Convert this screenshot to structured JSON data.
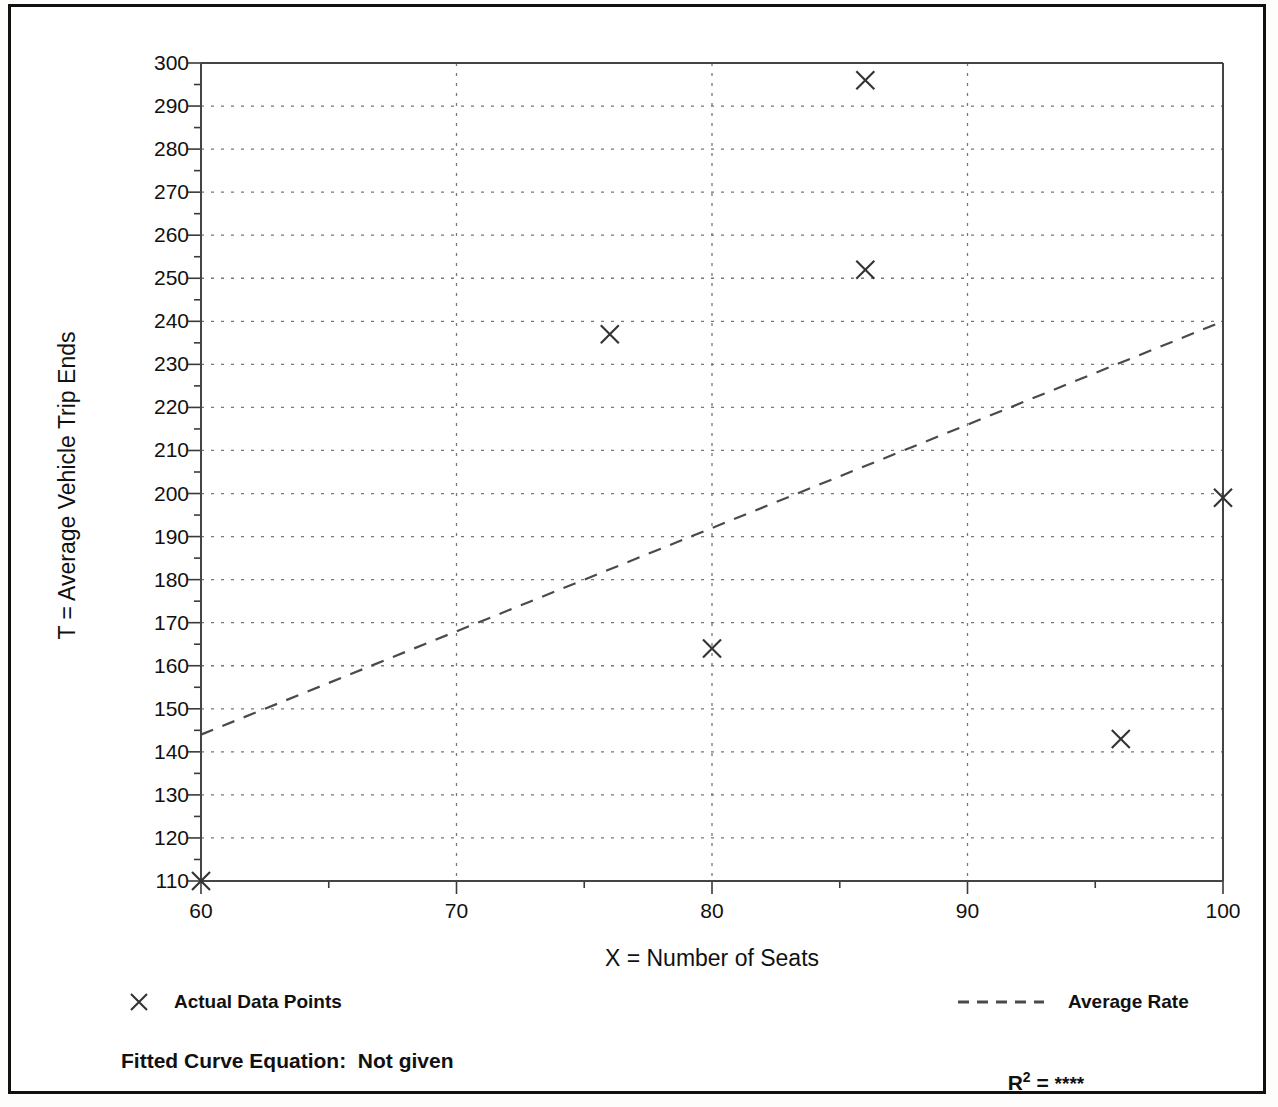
{
  "chart_data": {
    "type": "scatter",
    "title": "",
    "xlabel": "X = Number of Seats",
    "ylabel": "T = Average Vehicle Trip Ends",
    "xlim": [
      60,
      100
    ],
    "ylim": [
      110,
      300
    ],
    "xticks": [
      60,
      70,
      80,
      90,
      100
    ],
    "yticks": [
      110,
      120,
      130,
      140,
      150,
      160,
      170,
      180,
      190,
      200,
      210,
      220,
      230,
      240,
      250,
      260,
      270,
      280,
      290,
      300
    ],
    "x_minor_step": 5,
    "y_minor_step": 5,
    "grid": true,
    "grid_style": "dotted",
    "legend_position": "below-plot",
    "series": [
      {
        "name": "Actual Data Points",
        "type": "scatter",
        "marker": "x",
        "points": [
          {
            "x": 60,
            "y": 110
          },
          {
            "x": 76,
            "y": 237
          },
          {
            "x": 80,
            "y": 164
          },
          {
            "x": 86,
            "y": 252
          },
          {
            "x": 86,
            "y": 296
          },
          {
            "x": 96,
            "y": 143
          },
          {
            "x": 100,
            "y": 199
          }
        ]
      },
      {
        "name": "Average Rate",
        "type": "line",
        "style": "dashed",
        "points": [
          {
            "x": 60,
            "y": 144
          },
          {
            "x": 100,
            "y": 240
          }
        ]
      }
    ]
  },
  "legend": {
    "data_points_label": "Actual Data Points",
    "average_rate_label": "Average Rate"
  },
  "footer": {
    "fitted_curve_label": "Fitted Curve Equation:  Not given",
    "r_squared_symbol": "R",
    "r_squared_exponent": "2",
    "r_squared_equals": " = ",
    "r_squared_value": "****"
  },
  "colors": {
    "ink": "#111111",
    "axis": "#444444",
    "grid": "#777777",
    "marker": "#333333",
    "trendline": "#4a4a4a",
    "page": "#ffffff"
  }
}
